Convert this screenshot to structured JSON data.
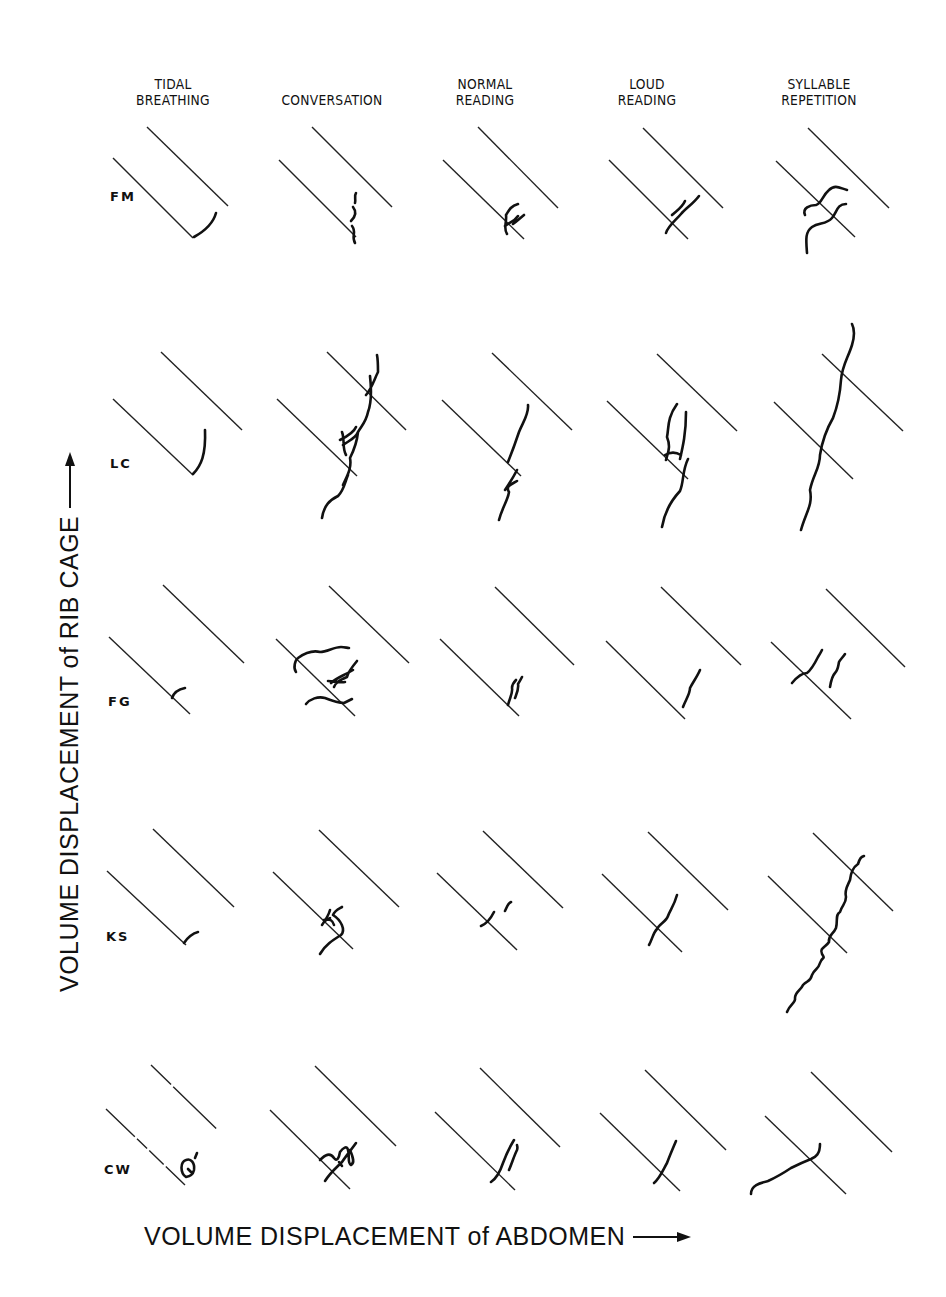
{
  "figure": {
    "columns": [
      {
        "line1": "TIDAL",
        "line2": "BREATHING"
      },
      {
        "line1": "",
        "line2": "CONVERSATION"
      },
      {
        "line1": "NORMAL",
        "line2": "READING"
      },
      {
        "line1": "LOUD",
        "line2": "READING"
      },
      {
        "line1": "SYLLABLE",
        "line2": "REPETITION"
      }
    ],
    "rows": [
      "FM",
      "LC",
      "FG",
      "KS",
      "CW"
    ],
    "y_axis_label": "VOLUME DISPLACEMENT of RIB CAGE",
    "x_axis_label": "VOLUME DISPLACEMENT of ABDOMEN",
    "y_axis_arrow": "arrow-up-icon",
    "x_axis_arrow": "arrow-right-icon",
    "ink_color": "#111111"
  }
}
